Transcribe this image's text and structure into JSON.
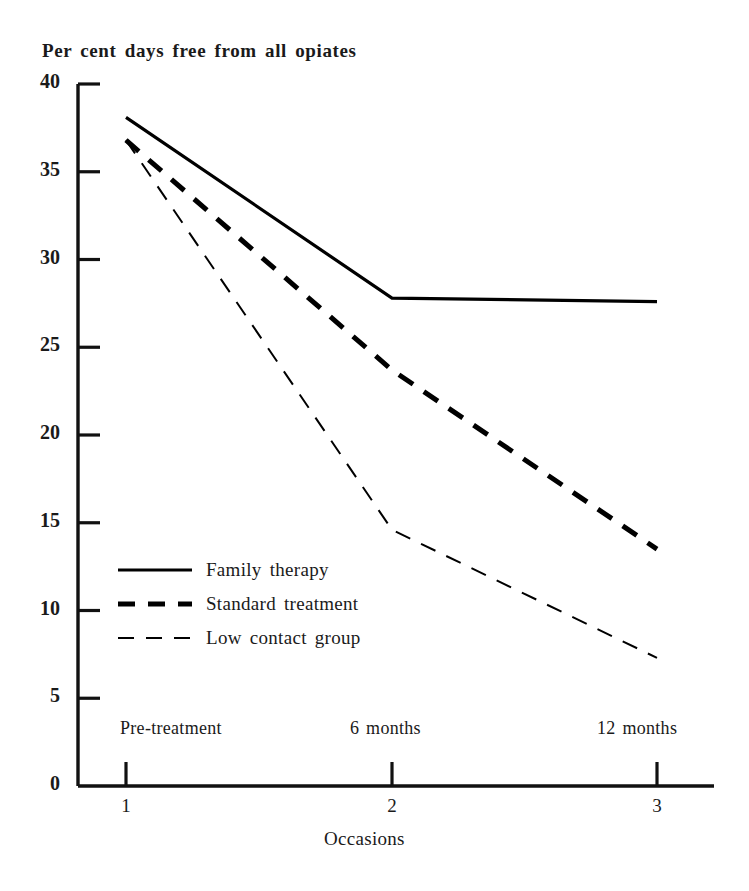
{
  "chart_data": {
    "type": "line",
    "title": "Per cent days free from all opiates",
    "xlabel": "Occasions",
    "ylabel": "",
    "x": [
      1,
      2,
      3
    ],
    "categories": [
      "1",
      "2",
      "3"
    ],
    "x_tick_labels": [
      "1",
      "2",
      "3"
    ],
    "x_point_labels": [
      "Pre-treatment",
      "6 months",
      "12 months"
    ],
    "y_tick_labels": [
      "0",
      "5",
      "10",
      "15",
      "20",
      "25",
      "30",
      "35",
      "40"
    ],
    "y_ticks": [
      0,
      5,
      10,
      15,
      20,
      25,
      30,
      35,
      40
    ],
    "ylim": [
      0,
      40
    ],
    "xlim": [
      1,
      3
    ],
    "grid": false,
    "legend_position": "inside-lower-left",
    "series": [
      {
        "name": "Family therapy",
        "style": "solid",
        "color": "#000000",
        "width": 3.2,
        "values": [
          38.1,
          27.8,
          27.6
        ]
      },
      {
        "name": "Standard treatment",
        "style": "dashed-thick",
        "color": "#000000",
        "width": 5.0,
        "values": [
          36.8,
          23.7,
          13.5
        ]
      },
      {
        "name": "Low contact group",
        "style": "dashed-thin",
        "color": "#000000",
        "width": 2.0,
        "values": [
          36.8,
          14.6,
          7.3
        ]
      }
    ]
  },
  "axes": {
    "y_labels": [
      {
        "text": "40",
        "value": 40
      },
      {
        "text": "35",
        "value": 35
      },
      {
        "text": "30",
        "value": 30
      },
      {
        "text": "25",
        "value": 25
      },
      {
        "text": "20",
        "value": 20
      },
      {
        "text": "15",
        "value": 15
      },
      {
        "text": "10",
        "value": 10
      },
      {
        "text": "5",
        "value": 5
      },
      {
        "text": "0",
        "value": 0
      }
    ],
    "x_numbers": [
      "1",
      "2",
      "3"
    ],
    "x_occasions": [
      "Pre-treatment",
      "6 months",
      "12 months"
    ],
    "x_axis_title": "Occasions"
  },
  "legend": {
    "items": [
      {
        "label": "Family therapy",
        "style": "solid"
      },
      {
        "label": "Standard treatment",
        "style": "dashed-thick"
      },
      {
        "label": "Low contact group",
        "style": "dashed-thin"
      }
    ]
  },
  "colors": {
    "ink": "#000000",
    "paper": "#ffffff"
  }
}
